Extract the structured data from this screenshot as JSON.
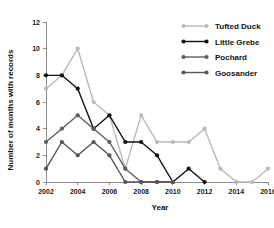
{
  "chart_data": {
    "type": "line",
    "title": "",
    "xlabel": "Year",
    "ylabel": "Number of months with records",
    "x": [
      2002,
      2003,
      2004,
      2005,
      2006,
      2007,
      2008,
      2009,
      2010,
      2011,
      2012,
      2013,
      2014,
      2015,
      2016
    ],
    "xlim": [
      2002,
      2016
    ],
    "ylim": [
      0,
      12
    ],
    "xticks": [
      2002,
      2004,
      2006,
      2008,
      2010,
      2012,
      2014,
      2016
    ],
    "xtick_labels": [
      "2002",
      "2004",
      "2006",
      "2008",
      "2010",
      "2012",
      "2014",
      "2016"
    ],
    "yticks": [
      0,
      2,
      4,
      6,
      8,
      10,
      12
    ],
    "ytick_labels": [
      "0",
      "2",
      "4",
      "6",
      "8",
      "10",
      "12"
    ],
    "grid": false,
    "legend_position": "top-right",
    "series": [
      {
        "name": "Tufted Duck",
        "color": "#b9b9b9",
        "values": [
          7,
          8,
          10,
          6,
          5,
          1,
          5,
          3,
          3,
          3,
          4,
          1,
          0,
          0,
          1
        ]
      },
      {
        "name": "Little Grebe",
        "color": "#111111",
        "values": [
          8,
          8,
          7,
          4,
          5,
          3,
          3,
          2,
          0,
          1,
          0,
          null,
          null,
          null,
          null
        ]
      },
      {
        "name": "Pochard",
        "color": "#5e5e5e",
        "values": [
          3,
          4,
          5,
          4,
          3,
          1,
          0,
          0,
          0,
          null,
          null,
          null,
          null,
          null,
          null
        ]
      },
      {
        "name": "Goosander",
        "color": "#555555",
        "values": [
          1,
          3,
          2,
          3,
          2,
          0,
          0,
          0,
          0,
          null,
          null,
          null,
          null,
          null,
          null
        ]
      }
    ]
  },
  "legend": {
    "items": [
      {
        "label": "Tufted Duck"
      },
      {
        "label": "Little Grebe"
      },
      {
        "label": "Pochard"
      },
      {
        "label": "Goosander"
      }
    ]
  }
}
